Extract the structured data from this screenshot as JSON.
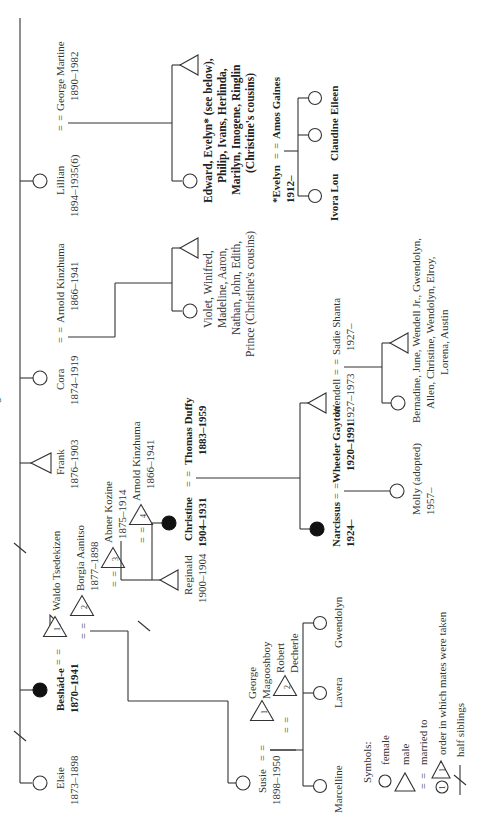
{
  "title": "Genealogical Chart 2",
  "generation1": {
    "elsie": {
      "name": "Elsie",
      "dates": "1873–1898",
      "sex": "female"
    },
    "beshade": {
      "name": "Beshád-e",
      "dates": "1870–1941",
      "sex": "female",
      "highlighted": true
    },
    "waldo": {
      "name": "Waldo Tsedekizen",
      "order": "1",
      "sex": "male"
    },
    "borgia": {
      "name": "Borgia Aanitso",
      "dates": "1877–1898",
      "order": "2",
      "sex": "male"
    },
    "abner": {
      "name": "Abner Kozine",
      "dates": "1875–1914",
      "order": "3",
      "sex": "male"
    },
    "arnold4": {
      "name": "Arnold Kinzhuma",
      "dates": "1866–1941",
      "order": "4",
      "sex": "male"
    },
    "frank": {
      "name": "Frank",
      "dates": "1876–1903",
      "sex": "male"
    },
    "cora": {
      "name": "Cora",
      "dates": "1874–1919",
      "sex": "female"
    },
    "arnold_cora": {
      "name": "Arnold Kinzhuma",
      "dates": "1866–1941",
      "sex": "male"
    },
    "lillian": {
      "name": "Lillian",
      "dates": "1894–1935(6)",
      "sex": "female"
    },
    "george_martine": {
      "name": "George Martine",
      "dates": "1890–1982",
      "sex": "male"
    }
  },
  "generation2": {
    "susie": {
      "name": "Susie",
      "dates": "1898–1950",
      "sex": "female"
    },
    "george_mag": {
      "name_line1": "George",
      "name_line2": "Magooshboy",
      "order": "1",
      "sex": "male"
    },
    "robert": {
      "name_line1": "Robert",
      "name_line2": "Decherle",
      "order": "2",
      "sex": "male"
    },
    "reginald": {
      "name": "Reginald",
      "dates": "1900–1904",
      "sex": "male"
    },
    "christine": {
      "name": "Christine",
      "dates": "1904–1931",
      "sex": "female",
      "highlighted": true
    },
    "thomas": {
      "name": "Thomas Duffy",
      "dates": "1883–1959",
      "sex": "male"
    },
    "cora_children": {
      "lines": [
        "Violet, Winifred,",
        "Madeline, Aaron,",
        "Nathan, John, Edith,",
        "Prince (Christine's cousins)"
      ]
    },
    "lillian_children": {
      "lines": [
        "Edward, Evelyn* (see below),",
        "Philip, Ivans, Herlinda,",
        "Marilyn, Imogene, Ringlin",
        "(Christine's cousins)"
      ]
    }
  },
  "generation3": {
    "marcelline": {
      "name": "Marcelline",
      "sex": "female"
    },
    "lavera": {
      "name": "Lavera",
      "sex": "female"
    },
    "gwendolyn": {
      "name": "Gwendolyn",
      "sex": "female"
    },
    "narcissus": {
      "name": "Narcissus",
      "dates": "1924–",
      "sex": "female",
      "highlighted": true
    },
    "wheeler": {
      "name": "Wheeler Gayton",
      "dates": "1920–1991",
      "sex": "male"
    },
    "wendell": {
      "name": "Wendell",
      "dates": "1927–1973",
      "sex": "male"
    },
    "sadie": {
      "name": "Sadie Shanta",
      "dates": "1927–",
      "sex": "female"
    },
    "evelyn": {
      "name": "*Evelyn",
      "dates": "1912–",
      "sex": "female"
    },
    "amos": {
      "name": "Amos Gaines",
      "sex": "male"
    }
  },
  "generation4": {
    "molly": {
      "name": "Molly (adopted)",
      "dates": "1957–",
      "sex": "female"
    },
    "wendell_children": {
      "lines": [
        "Bernadine, June, Wendell Jr., Gwendolyn,",
        "Allen, Christine, Wendolyn, Elroy,",
        "Lorena, Austin"
      ]
    },
    "ivora": {
      "name": "Ivora Lou",
      "sex": "female"
    },
    "claudine": {
      "name": "Claudine",
      "sex": "female"
    },
    "eileen": {
      "name": "Eileen",
      "sex": "female"
    }
  },
  "marriage_symbol": "= =",
  "legend": {
    "heading": "Symbols:",
    "items": [
      {
        "symbol": "circle",
        "label": "female"
      },
      {
        "symbol": "triangle",
        "label": "male"
      },
      {
        "symbol": "= =",
        "label": "married to"
      },
      {
        "symbol": "numbered",
        "number": "1",
        "label": "order in which mates were taken"
      },
      {
        "symbol": "—/—",
        "label": "half siblings"
      }
    ]
  }
}
